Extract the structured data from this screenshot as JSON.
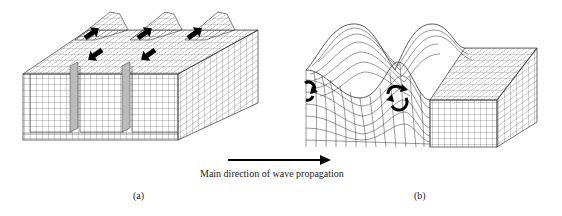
{
  "figure": {
    "panels": [
      {
        "id": "a",
        "label": "(a)",
        "description": "Block with vertical walls moving alternately (shear horizontal motion) - arrows up/down alternate",
        "arrow_count": 5
      },
      {
        "id": "b",
        "label": "(b)",
        "description": "Block with wave surface deformation and rotational particle motion",
        "rotation_markers": 2
      }
    ],
    "propagation": {
      "label": "Main direction of wave propagation",
      "arrow_icon": "right-arrow"
    },
    "colors": {
      "line": "#333333",
      "arrow_fill": "#000000",
      "background": "#ffffff"
    }
  }
}
